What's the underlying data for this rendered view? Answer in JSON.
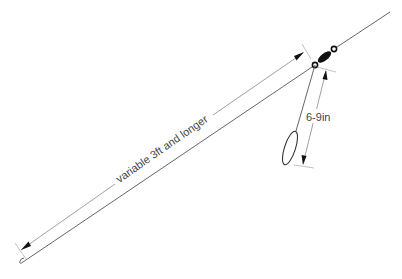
{
  "diagram": {
    "title": "",
    "labels": {
      "main_length": "variable 3ft and longer",
      "dropper_length": "6-9in"
    },
    "components": [
      {
        "name": "main-line",
        "role": "leader"
      },
      {
        "name": "swivel",
        "role": "connector"
      },
      {
        "name": "dropper-line",
        "role": "snood"
      },
      {
        "name": "dropper-loop",
        "role": "loop"
      },
      {
        "name": "hook-end",
        "role": "terminal"
      }
    ],
    "colors": {
      "line": "#555555",
      "swivel": "#111111",
      "text": "#444444"
    }
  }
}
